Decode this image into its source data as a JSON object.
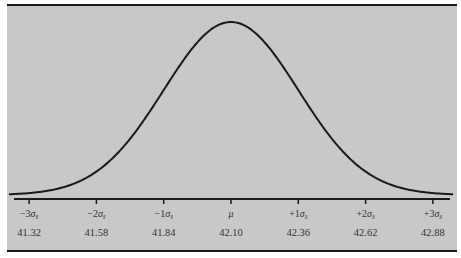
{
  "chart_data": {
    "type": "line",
    "title": "",
    "xlabel": "",
    "ylabel": "",
    "distribution": {
      "mean": 42.1,
      "std_error": 0.26
    },
    "x_range_sigma": [
      -3.3,
      3.3
    ],
    "ticks": [
      {
        "sigma": -3,
        "label_prefix": "−3",
        "value": "41.32"
      },
      {
        "sigma": -2,
        "label_prefix": "−2",
        "value": "41.58"
      },
      {
        "sigma": -1,
        "label_prefix": "−1",
        "value": "41.84"
      },
      {
        "sigma": 0,
        "label_prefix": "",
        "value": "42.10",
        "is_mean": true
      },
      {
        "sigma": 1,
        "label_prefix": "+1",
        "value": "42.36"
      },
      {
        "sigma": 2,
        "label_prefix": "+2",
        "value": "42.62"
      },
      {
        "sigma": 3,
        "label_prefix": "+3",
        "value": "42.88"
      }
    ],
    "sigma_symbol": "σ",
    "sigma_subscript": "x̄",
    "mean_symbol": "μ",
    "grid": false,
    "legend": "none"
  },
  "colors": {
    "background": "#c8c8c8",
    "curve": "#1a1a1a",
    "axis": "#1a1a1a",
    "text": "#333333"
  }
}
